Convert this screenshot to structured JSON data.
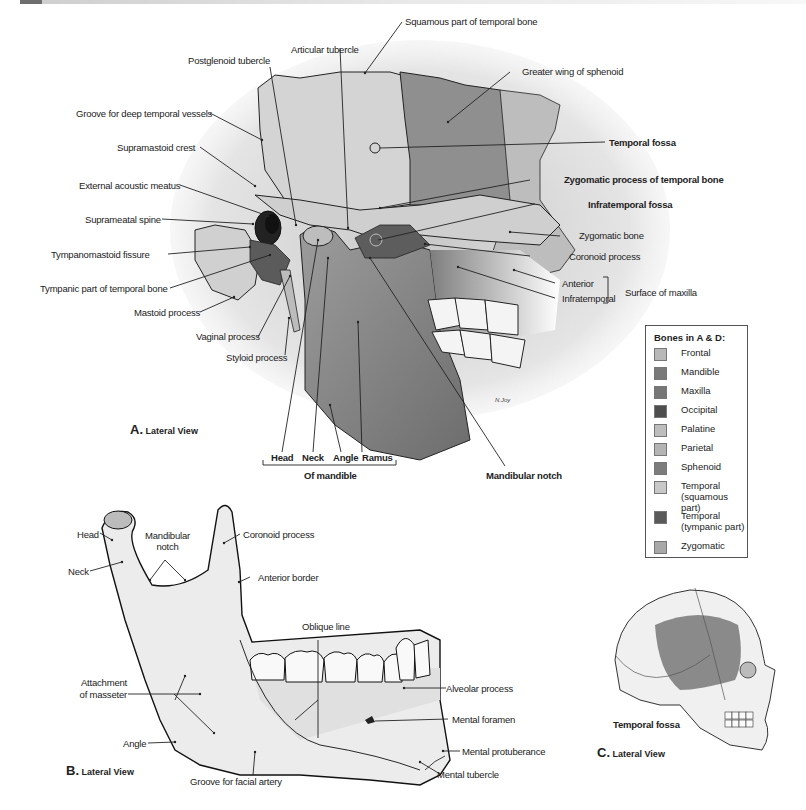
{
  "panel_a": {
    "view_letter": "A.",
    "view_label": "Lateral View",
    "labels": {
      "postglenoid_tubercle": "Postglenoid tubercle",
      "articular_tubercle": "Articular tubercle",
      "squamous_part": "Squamous part of temporal bone",
      "greater_wing": "Greater wing of sphenoid",
      "groove_deep_temporal": "Groove for deep temporal vessels",
      "supramastoid_crest": "Supramastoid crest",
      "external_acoustic_meatus": "External acoustic meatus",
      "suprameatal_spine": "Suprameatal spine",
      "tympanomastoid_fissure": "Tympanomastoid fissure",
      "tympanic_part": "Tympanic part of temporal bone",
      "mastoid_process": "Mastoid process",
      "vaginal_process": "Vaginal process",
      "styloid_process": "Styloid process",
      "temporal_fossa": "Temporal fossa",
      "zygomatic_process": "Zygomatic process of temporal bone",
      "infratemporal_fossa": "Infratemporal fossa",
      "zygomatic_bone": "Zygomatic bone",
      "coronoid_process": "Coronoid process",
      "anterior": "Anterior",
      "infratemporal": "Infratemporal",
      "surface_of_maxilla": "Surface of maxilla",
      "mandibular_notch": "Mandibular notch",
      "head": "Head",
      "neck": "Neck",
      "angle": "Angle",
      "ramus": "Ramus",
      "of_mandible": "Of mandible",
      "signature": "N.Joy"
    }
  },
  "panel_b": {
    "view_letter": "B.",
    "view_label": "Lateral View",
    "labels": {
      "head": "Head",
      "neck": "Neck",
      "mandibular_notch_1": "Mandibular",
      "mandibular_notch_2": "notch",
      "coronoid_process": "Coronoid process",
      "anterior_border": "Anterior border",
      "oblique_line": "Oblique line",
      "attachment_1": "Attachment",
      "attachment_2": "of masseter",
      "alveolar_process": "Alveolar process",
      "mental_foramen": "Mental foramen",
      "angle": "Angle",
      "mental_protuberance": "Mental protuberance",
      "groove_facial_artery": "Groove for facial artery",
      "mental_tubercle": "Mental tubercle"
    }
  },
  "panel_c": {
    "view_letter": "C.",
    "view_label": "Lateral View",
    "labels": {
      "temporal_fossa": "Temporal fossa"
    }
  },
  "legend": {
    "title": "Bones in A & D:",
    "items": [
      {
        "name": "Frontal",
        "color": "#b8b8b8"
      },
      {
        "name": "Mandible",
        "color": "#7a7a7a"
      },
      {
        "name": "Maxilla",
        "color": "#767676"
      },
      {
        "name": "Occipital",
        "color": "#4e4e4e"
      },
      {
        "name": "Palatine",
        "color": "#bdbdbd"
      },
      {
        "name": "Parietal",
        "color": "#b4b4b4"
      },
      {
        "name": "Sphenoid",
        "color": "#7c7c7c"
      },
      {
        "name": "Temporal",
        "name2": "(squamous part)",
        "color": "#c8c8c8"
      },
      {
        "name": "Temporal",
        "name2": "(tympanic part)",
        "color": "#5a5a5a"
      },
      {
        "name": "Zygomatic",
        "color": "#a8a8a8"
      }
    ]
  }
}
